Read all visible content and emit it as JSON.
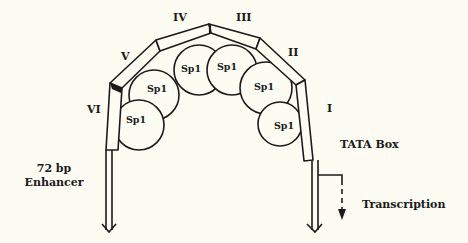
{
  "figure": {
    "segments": [
      {
        "id": "I",
        "label": "I"
      },
      {
        "id": "II",
        "label": "II"
      },
      {
        "id": "III",
        "label": "III"
      },
      {
        "id": "IV",
        "label": "IV"
      },
      {
        "id": "V",
        "label": "V"
      },
      {
        "id": "VI",
        "label": "VI"
      }
    ],
    "proteins": [
      {
        "label": "Sp1"
      },
      {
        "label": "Sp1"
      },
      {
        "label": "Sp1"
      },
      {
        "label": "Sp1"
      },
      {
        "label": "Sp1"
      },
      {
        "label": "Sp1"
      }
    ],
    "enhancer_label_line1": "72 bp",
    "enhancer_label_line2": "Enhancer",
    "tata_label": "TATA Box",
    "transcription_label": "Transcription"
  }
}
